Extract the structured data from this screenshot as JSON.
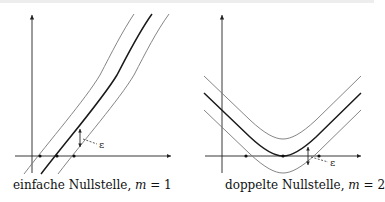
{
  "figure": {
    "left_panel": {
      "caption_text": "einfache Nullstelle, ",
      "caption_var": "m",
      "caption_eq": " = 1",
      "epsilon_label": "ε",
      "curves": [
        "upper (f+ε)",
        "middle (f)",
        "lower (f−ε)"
      ],
      "root_markers": 3
    },
    "right_panel": {
      "caption_text": "doppelte Nullstelle, ",
      "caption_var": "m",
      "caption_eq": " = 2",
      "epsilon_label": "ε",
      "curves": [
        "upper (f+ε)",
        "middle (f)",
        "lower (f−ε)"
      ],
      "root_markers": 3
    },
    "colors": {
      "axis": "#222222",
      "main_curve": "#1a1a1a",
      "band_curve": "#777777"
    }
  }
}
